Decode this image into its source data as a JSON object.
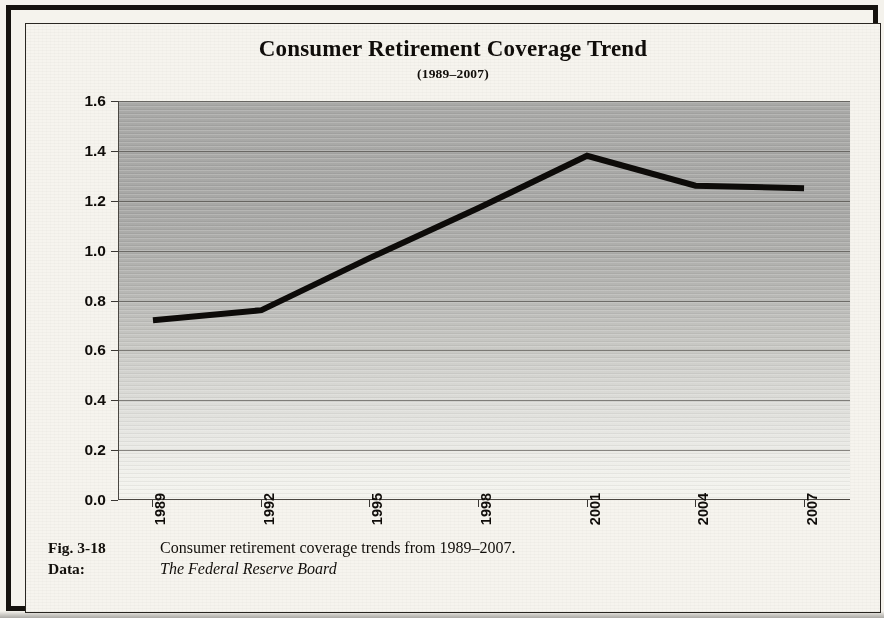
{
  "figure": {
    "title": "Consumer Retirement Coverage Trend",
    "subtitle": "(1989–2007)",
    "caption": {
      "fig_label": "Fig. 3-18",
      "fig_text": "Consumer retirement coverage trends from 1989–2007.",
      "data_label": "Data:",
      "data_source": "The Federal Reserve Board"
    },
    "colors": {
      "line": "#0d0b09",
      "plot_background_top": "#a9a9a7",
      "plot_background_bottom": "#f4f4ef",
      "frame": "#15120e",
      "paper": "#f5f3ed",
      "gridline": "#3c3934"
    }
  },
  "chart_data": {
    "type": "line",
    "title": "Consumer Retirement Coverage Trend",
    "subtitle": "(1989–2007)",
    "xlabel": "",
    "ylabel": "",
    "categories": [
      "1989",
      "1992",
      "1995",
      "1998",
      "2001",
      "2004",
      "2007"
    ],
    "x": [
      1989,
      1992,
      1995,
      1998,
      2001,
      2004,
      2007
    ],
    "values": [
      0.72,
      0.76,
      0.97,
      1.17,
      1.38,
      1.26,
      1.25
    ],
    "series": [
      {
        "name": "Consumer retirement coverage",
        "values": [
          0.72,
          0.76,
          0.97,
          1.17,
          1.38,
          1.26,
          1.25
        ]
      }
    ],
    "ylim": [
      0.0,
      1.6
    ],
    "ytick_values": [
      0.0,
      0.2,
      0.4,
      0.6,
      0.8,
      1.0,
      1.2,
      1.4,
      1.6
    ],
    "ytick_labels": [
      "0.0",
      "0.2",
      "0.4",
      "0.6",
      "0.8",
      "1.0",
      "1.2",
      "1.4",
      "1.6"
    ],
    "xtick_labels": [
      "1989",
      "1992",
      "1995",
      "1998",
      "2001",
      "2004",
      "2007"
    ],
    "xtick_rotation": -90,
    "grid": true,
    "grid_axis": "y",
    "legend": false,
    "legend_position": "none",
    "line_color": "#0d0b09",
    "line_width": 6,
    "markers": false
  }
}
